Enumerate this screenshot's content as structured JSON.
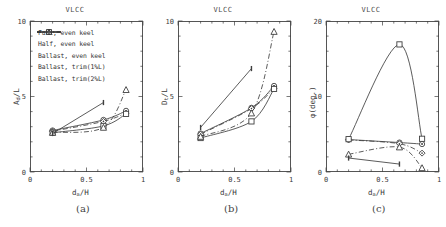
{
  "figure": {
    "title": "VLCC",
    "panel_captions": [
      "(a)",
      "(b)",
      "(c)"
    ],
    "xlabel_html": "d<sub>a</sub>/H"
  },
  "legend": {
    "entries": [
      {
        "label": "Full, even keel",
        "marker": "circle-dot",
        "dash": "solid"
      },
      {
        "label": "Half, even keel",
        "marker": "diamond",
        "dash": "dashdot"
      },
      {
        "label": "Ballast, even keel",
        "marker": "square",
        "dash": "solid"
      },
      {
        "label": "Ballast, trim(1%L)",
        "marker": "triangle",
        "dash": "dashdot"
      },
      {
        "label": "Ballast, trim(2%L)",
        "marker": "tick",
        "dash": "solid"
      }
    ]
  },
  "chart_data": [
    {
      "type": "line",
      "panel": "(a)",
      "title": "VLCC",
      "xlabel": "d_a/H",
      "ylabel": "A_d/L",
      "xlim": [
        0,
        1
      ],
      "ylim": [
        0,
        10
      ],
      "xticks": [
        0,
        0.5,
        1
      ],
      "yticks": [
        0,
        5,
        10
      ],
      "xticklabels": [
        "0",
        "0.5",
        "1"
      ],
      "yticklabels": [
        "0",
        "5",
        "10"
      ],
      "grid": false,
      "series": [
        {
          "name": "Full, even keel",
          "x": [
            0.2,
            0.65,
            0.85
          ],
          "y": [
            2.75,
            3.45,
            4.05
          ]
        },
        {
          "name": "Half, even keel",
          "x": [
            0.2,
            0.65,
            0.85
          ],
          "y": [
            2.7,
            3.35,
            3.9
          ]
        },
        {
          "name": "Ballast, even keel",
          "x": [
            0.2,
            0.65,
            0.85
          ],
          "y": [
            2.6,
            3.05,
            3.85
          ]
        },
        {
          "name": "Ballast, trim(1%L)",
          "x": [
            0.2,
            0.65,
            0.85
          ],
          "y": [
            2.62,
            2.95,
            5.45
          ]
        },
        {
          "name": "Ballast, trim(2%L)",
          "x": [
            0.2,
            0.65
          ],
          "y": [
            2.55,
            4.6
          ]
        }
      ]
    },
    {
      "type": "line",
      "panel": "(b)",
      "title": "VLCC",
      "xlabel": "d_a/H",
      "ylabel": "D_t/L",
      "xlim": [
        0,
        1
      ],
      "ylim": [
        0,
        10
      ],
      "xticks": [
        0,
        0.5,
        1
      ],
      "yticks": [
        0,
        5,
        10
      ],
      "xticklabels": [
        "0",
        "0.5",
        "1"
      ],
      "yticklabels": [
        "0",
        "5",
        "10"
      ],
      "grid": false,
      "series": [
        {
          "name": "Full, even keel",
          "x": [
            0.2,
            0.65,
            0.85
          ],
          "y": [
            2.55,
            4.25,
            5.7
          ]
        },
        {
          "name": "Half, even keel",
          "x": [
            0.2,
            0.65,
            0.85
          ],
          "y": [
            2.5,
            4.2,
            5.55
          ]
        },
        {
          "name": "Ballast, even keel",
          "x": [
            0.2,
            0.65,
            0.85
          ],
          "y": [
            2.25,
            3.35,
            5.5
          ]
        },
        {
          "name": "Ballast, trim(1%L)",
          "x": [
            0.2,
            0.65,
            0.85
          ],
          "y": [
            2.35,
            3.9,
            9.3
          ]
        },
        {
          "name": "Ballast, trim(2%L)",
          "x": [
            0.2,
            0.65
          ],
          "y": [
            2.95,
            6.85
          ]
        }
      ]
    },
    {
      "type": "line",
      "panel": "(c)",
      "title": "VLCC",
      "xlabel": "d_a/H",
      "ylabel": "phi (deg.)",
      "xlim": [
        0,
        1
      ],
      "ylim": [
        0,
        20
      ],
      "xticks": [
        0,
        0.5,
        1
      ],
      "yticks": [
        0,
        10,
        20
      ],
      "xticklabels": [
        "0",
        "0.5",
        "1"
      ],
      "yticklabels": [
        "0",
        "10",
        "20"
      ],
      "grid": false,
      "series": [
        {
          "name": "Full, even keel",
          "x": [
            0.2,
            0.65,
            0.85
          ],
          "y": [
            4.3,
            3.9,
            3.7
          ]
        },
        {
          "name": "Half, even keel",
          "x": [
            0.2,
            0.65,
            0.85
          ],
          "y": [
            4.25,
            3.75,
            2.5
          ]
        },
        {
          "name": "Ballast, even keel",
          "x": [
            0.2,
            0.65,
            0.85
          ],
          "y": [
            4.35,
            16.9,
            4.4
          ]
        },
        {
          "name": "Ballast, trim(1%L)",
          "x": [
            0.2,
            0.65,
            0.85
          ],
          "y": [
            2.35,
            3.3,
            0.55
          ]
        },
        {
          "name": "Ballast, trim(2%L)",
          "x": [
            0.2,
            0.65
          ],
          "y": [
            1.85,
            1.05
          ]
        }
      ]
    }
  ]
}
